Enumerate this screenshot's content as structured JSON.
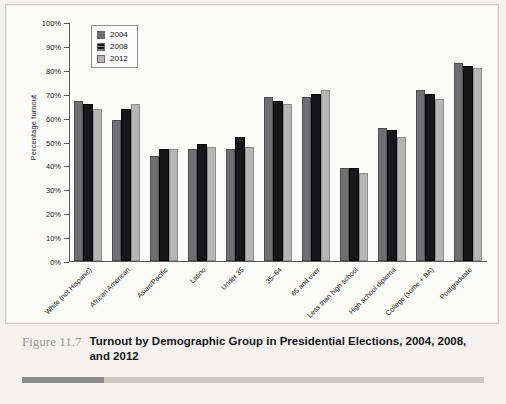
{
  "figure": {
    "number": "Figure 11.7",
    "title": "Turnout by Demographic Group in Presidential Elections, 2004, 2008, and 2012"
  },
  "chart_data": {
    "type": "bar",
    "title": "",
    "xlabel": "",
    "ylabel": "Percentage turnout",
    "ylim": [
      0,
      100
    ],
    "ytick_labels": [
      "100%",
      "90%",
      "80%",
      "70%",
      "60%",
      "50%",
      "40%",
      "30%",
      "20%",
      "10%",
      "0%"
    ],
    "ytick_values": [
      100,
      90,
      80,
      70,
      60,
      50,
      40,
      30,
      20,
      10,
      0
    ],
    "grid": false,
    "legend_position": "top-left",
    "categories": [
      "White (not Hispanic)",
      "African American",
      "Asian/Pacific",
      "Latino",
      "Under 35",
      "35–64",
      "65 and over",
      "Less than high school",
      "High school diploma",
      "College (some + BA)",
      "Postgraduate"
    ],
    "series": [
      {
        "name": "2004",
        "color": "#6f6f71",
        "values": [
          67,
          59,
          44,
          47,
          47,
          69,
          69,
          39,
          56,
          72,
          83
        ]
      },
      {
        "name": "2008",
        "color": "#17171a",
        "values": [
          66,
          64,
          47,
          49,
          52,
          67,
          70,
          39,
          55,
          70,
          82
        ]
      },
      {
        "name": "2012",
        "color": "#b6b6b6",
        "values": [
          64,
          66,
          47,
          48,
          48,
          66,
          72,
          37,
          52,
          68,
          81
        ]
      }
    ]
  }
}
